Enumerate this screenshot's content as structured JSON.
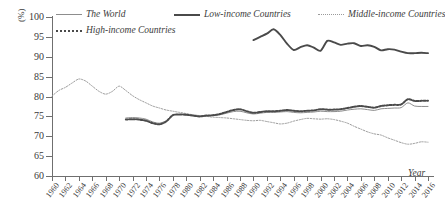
{
  "chart_data": {
    "type": "line",
    "title": "",
    "xlabel": "Year",
    "ylabel": "(%)",
    "ylim": [
      60,
      100
    ],
    "xlim": [
      1960,
      2016
    ],
    "ytick_labels": [
      "100",
      "95",
      "90",
      "85",
      "80",
      "75",
      "70",
      "65",
      "60"
    ],
    "ytick_values": [
      100,
      95,
      90,
      85,
      80,
      75,
      70,
      65,
      60
    ],
    "xtick_labels": [
      "1960",
      "1962",
      "1964",
      "1966",
      "1968",
      "1970",
      "1972",
      "1974",
      "1976",
      "1978",
      "1980",
      "1982",
      "1984",
      "1986",
      "1988",
      "1990",
      "1992",
      "1994",
      "1996",
      "1998",
      "2000",
      "2002",
      "2004",
      "2006",
      "2008",
      "2010",
      "2012",
      "2014",
      "2016"
    ],
    "xtick_values": [
      1960,
      1962,
      1964,
      1966,
      1968,
      1970,
      1972,
      1974,
      1976,
      1978,
      1980,
      1982,
      1984,
      1986,
      1988,
      1990,
      1992,
      1994,
      1996,
      1998,
      2000,
      2002,
      2004,
      2006,
      2008,
      2010,
      2012,
      2014,
      2016
    ],
    "grid": false,
    "legend_position": "top",
    "series": [
      {
        "name": "The World",
        "style": "solid-thin",
        "color": "#8d8d8d",
        "x": [
          1971,
          1972,
          1973,
          1974,
          1975,
          1976,
          1977,
          1978,
          1979,
          1980,
          1981,
          1982,
          1983,
          1984,
          1985,
          1986,
          1987,
          1988,
          1989,
          1990,
          1991,
          1992,
          1993,
          1994,
          1995,
          1996,
          1997,
          1998,
          1999,
          2000,
          2001,
          2002,
          2003,
          2004,
          2005,
          2006,
          2007,
          2008,
          2009,
          2010,
          2011,
          2012,
          2013,
          2014,
          2015,
          2016
        ],
        "values": [
          74.6,
          74.7,
          74.6,
          74.3,
          73.6,
          73.3,
          73.9,
          75.3,
          75.5,
          75.4,
          75.2,
          75.0,
          75.1,
          75.2,
          75.4,
          75.8,
          76.2,
          76.3,
          75.9,
          75.6,
          75.8,
          76.0,
          76.0,
          76.1,
          76.2,
          76.0,
          75.9,
          76.0,
          76.1,
          76.3,
          76.2,
          76.2,
          76.3,
          76.6,
          76.8,
          76.9,
          76.7,
          76.5,
          76.9,
          77.0,
          77.1,
          77.2,
          78.4,
          77.6,
          77.5,
          77.5
        ]
      },
      {
        "name": "Low-income Countries",
        "style": "solid-thick",
        "color": "#4a4a4a",
        "x": [
          1990,
          1991,
          1992,
          1993,
          1994,
          1995,
          1996,
          1997,
          1998,
          1999,
          2000,
          2001,
          2002,
          2003,
          2004,
          2005,
          2006,
          2007,
          2008,
          2009,
          2010,
          2011,
          2012,
          2013,
          2014,
          2015,
          2016
        ],
        "values": [
          94.2,
          95.0,
          95.8,
          96.9,
          95.5,
          93.3,
          91.7,
          92.4,
          92.9,
          92.3,
          91.5,
          94.0,
          93.6,
          93.0,
          93.3,
          93.4,
          92.7,
          92.9,
          92.5,
          91.6,
          91.9,
          91.8,
          91.3,
          90.9,
          90.9,
          91.0,
          90.9
        ]
      },
      {
        "name": "Middle-income Countries",
        "style": "dotted-thin",
        "color": "#9a9a9a",
        "x": [
          1960,
          1961,
          1962,
          1963,
          1964,
          1965,
          1966,
          1967,
          1968,
          1969,
          1970,
          1971,
          1972,
          1973,
          1974,
          1975,
          1976,
          1977,
          1978,
          1979,
          1980,
          1981,
          1982,
          1983,
          1984,
          1985,
          1986,
          1987,
          1988,
          1989,
          1990,
          1991,
          1992,
          1993,
          1994,
          1995,
          1996,
          1997,
          1998,
          1999,
          2000,
          2001,
          2002,
          2003,
          2004,
          2005,
          2006,
          2007,
          2008,
          2009,
          2010,
          2011,
          2012,
          2013,
          2014,
          2015,
          2016
        ],
        "values": [
          80.1,
          81.5,
          82.3,
          83.4,
          84.4,
          83.9,
          82.6,
          81.3,
          80.6,
          81.3,
          82.6,
          81.5,
          80.2,
          79.2,
          78.4,
          77.6,
          77.1,
          76.6,
          76.3,
          76.0,
          75.7,
          75.4,
          75.2,
          75.0,
          74.8,
          74.7,
          74.6,
          74.4,
          74.2,
          74.0,
          73.9,
          74.0,
          73.7,
          73.4,
          73.1,
          73.3,
          73.8,
          74.2,
          74.5,
          74.4,
          74.3,
          74.4,
          74.2,
          73.8,
          73.3,
          72.5,
          71.8,
          71.1,
          70.6,
          70.3,
          69.6,
          69.0,
          68.4,
          68.0,
          68.2,
          68.6,
          68.5
        ]
      },
      {
        "name": "High-income Countries",
        "style": "dotted-thick",
        "color": "#4a4a4a",
        "x": [
          1971,
          1972,
          1973,
          1974,
          1975,
          1976,
          1977,
          1978,
          1979,
          1980,
          1981,
          1982,
          1983,
          1984,
          1985,
          1986,
          1987,
          1988,
          1989,
          1990,
          1991,
          1992,
          1993,
          1994,
          1995,
          1996,
          1997,
          1998,
          1999,
          2000,
          2001,
          2002,
          2003,
          2004,
          2005,
          2006,
          2007,
          2008,
          2009,
          2010,
          2011,
          2012,
          2013,
          2014,
          2015,
          2016
        ],
        "values": [
          74.2,
          74.3,
          74.2,
          73.9,
          73.3,
          73.0,
          73.7,
          75.3,
          75.5,
          75.4,
          75.2,
          75.0,
          75.2,
          75.3,
          75.6,
          76.1,
          76.6,
          76.8,
          76.3,
          75.9,
          76.1,
          76.3,
          76.3,
          76.4,
          76.6,
          76.4,
          76.3,
          76.4,
          76.5,
          76.8,
          76.7,
          76.7,
          76.8,
          77.1,
          77.4,
          77.6,
          77.4,
          77.2,
          77.6,
          77.8,
          77.9,
          78.0,
          79.3,
          78.9,
          78.9,
          78.9
        ]
      }
    ]
  },
  "axes": {
    "y_title": "(%)",
    "x_title": "Year"
  },
  "legend": {
    "items": [
      {
        "label": "The World"
      },
      {
        "label": "Low-income Countries"
      },
      {
        "label": "Middle-income Countries"
      },
      {
        "label": "High-income Countries"
      }
    ]
  }
}
